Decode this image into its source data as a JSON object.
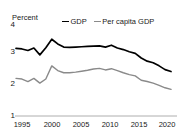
{
  "title_remnant": "",
  "axis": {
    "y_title": "Percent",
    "y_ticks": [
      "4",
      "3",
      "2",
      "1"
    ],
    "x_ticks": [
      "1995",
      "2000",
      "2005",
      "2010",
      "2015",
      "2020"
    ]
  },
  "legend": {
    "gdp_label": "GDP",
    "percapita_label": "Per capita GDP"
  },
  "colors": {
    "gdp": "#000000",
    "percapita": "#8a8a8a",
    "axis": "#9a9a9a"
  },
  "chart_data": {
    "type": "line",
    "title": "",
    "xlabel": "",
    "ylabel": "Percent",
    "xlim": [
      1994,
      2021
    ],
    "ylim": [
      1,
      4
    ],
    "grid": false,
    "legend_position": "top-center",
    "x": [
      1994,
      1995,
      1996,
      1997,
      1998,
      1999,
      2000,
      2001,
      2002,
      2003,
      2004,
      2005,
      2006,
      2007,
      2008,
      2009,
      2010,
      2011,
      2012,
      2013,
      2014,
      2015,
      2016,
      2017,
      2018,
      2019,
      2020
    ],
    "series": [
      {
        "name": "GDP",
        "color": "#000000",
        "values": [
          3.16,
          3.14,
          3.09,
          3.17,
          2.95,
          3.18,
          3.45,
          3.3,
          3.2,
          3.19,
          3.2,
          3.21,
          3.22,
          3.23,
          3.24,
          3.2,
          3.26,
          3.17,
          3.12,
          3.05,
          3.0,
          2.85,
          2.75,
          2.7,
          2.6,
          2.48,
          2.42
        ]
      },
      {
        "name": "Per capita GDP",
        "color": "#8a8a8a",
        "values": [
          2.2,
          2.18,
          2.1,
          2.2,
          2.05,
          2.18,
          2.6,
          2.45,
          2.38,
          2.38,
          2.4,
          2.43,
          2.46,
          2.5,
          2.52,
          2.47,
          2.51,
          2.45,
          2.38,
          2.32,
          2.28,
          2.14,
          2.1,
          2.05,
          1.98,
          1.9,
          1.85
        ]
      }
    ]
  }
}
